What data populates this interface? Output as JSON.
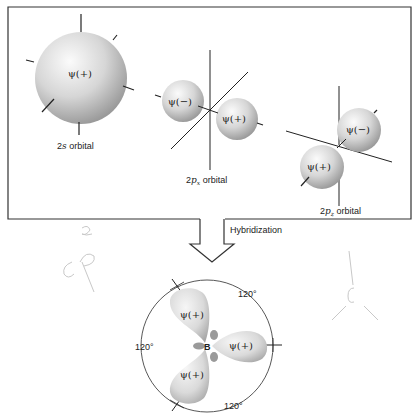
{
  "top_panel": {
    "orbitals": [
      {
        "name": "2s",
        "label_prefix": "2",
        "label_italic": "s",
        "label_sub": "",
        "label_suffix": " orbital",
        "lobes": [
          "ψ(+)"
        ]
      },
      {
        "name": "2px",
        "label_prefix": "2",
        "label_italic": "p",
        "label_sub": "x",
        "label_suffix": " orbital",
        "lobes": [
          "ψ(−)",
          "ψ(+)"
        ]
      },
      {
        "name": "2pz",
        "label_prefix": "2",
        "label_italic": "p",
        "label_sub": "z",
        "label_suffix": " orbital",
        "lobes": [
          "ψ(−)",
          "ψ(+)"
        ]
      }
    ]
  },
  "arrow": {
    "label": "Hybridization"
  },
  "bottom": {
    "center_atom": "B",
    "lobes": [
      "ψ(+)",
      "ψ(+)",
      "ψ(+)"
    ],
    "angles": [
      "120°",
      "120°",
      "120°"
    ]
  },
  "handwriting": {
    "left": "sp2"
  },
  "colors": {
    "line": "#222222",
    "sphere_light": "#f4f4f4",
    "sphere_dark": "#a9a9a9",
    "pencil": "#c8c8c8"
  }
}
